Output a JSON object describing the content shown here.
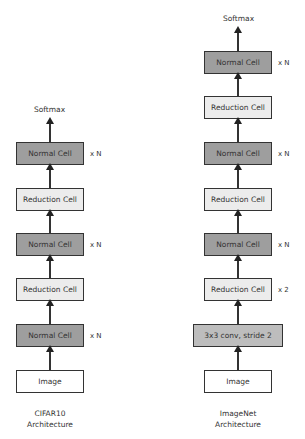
{
  "cifar": {
    "output": "Softmax",
    "blocks": [
      {
        "label": "Normal Cell",
        "mult": "x N"
      },
      {
        "label": "Reduction Cell",
        "mult": ""
      },
      {
        "label": "Normal Cell",
        "mult": "x N"
      },
      {
        "label": "Reduction Cell",
        "mult": ""
      },
      {
        "label": "Normal Cell",
        "mult": "x N"
      },
      {
        "label": "Image",
        "mult": ""
      }
    ],
    "caption_line1": "CIFAR10",
    "caption_line2": "Architecture"
  },
  "imagenet": {
    "output": "Softmax",
    "blocks": [
      {
        "label": "Normal Cell",
        "mult": "x N"
      },
      {
        "label": "Reduction Cell",
        "mult": ""
      },
      {
        "label": "Normal Cell",
        "mult": "x N"
      },
      {
        "label": "Reduction Cell",
        "mult": ""
      },
      {
        "label": "Normal Cell",
        "mult": "x N"
      },
      {
        "label": "Reduction Cell",
        "mult": "x 2"
      },
      {
        "label": "3x3 conv, stride 2",
        "mult": ""
      },
      {
        "label": "Image",
        "mult": ""
      }
    ],
    "caption_line1": "ImageNet",
    "caption_line2": "Architecture"
  },
  "colors": {
    "normal": "#9e9e9e",
    "reduction": "#ececec",
    "conv": "#bdbdbd",
    "image": "#ffffff"
  }
}
